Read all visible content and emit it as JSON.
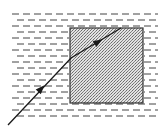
{
  "diagram": {
    "type": "refraction-ray-diagram",
    "media": [
      {
        "name": "liquid",
        "pattern": "horizontal-dashes",
        "region": {
          "x": 12,
          "y": 14,
          "width": 146,
          "height": 104
        }
      },
      {
        "name": "block",
        "pattern": "stipple",
        "fill": "#c8c8c8",
        "border": "#333333",
        "region": {
          "x": 70,
          "y": 28,
          "width": 73,
          "height": 75
        }
      }
    ],
    "ray": {
      "color": "#1a1a1a",
      "points": [
        [
          8,
          125
        ],
        [
          71,
          58
        ],
        [
          121,
          28
        ]
      ],
      "arrows": [
        {
          "at": [
            41,
            89
          ],
          "direction": "up-right"
        },
        {
          "at": [
            98,
            42
          ],
          "direction": "up-right"
        }
      ]
    }
  }
}
